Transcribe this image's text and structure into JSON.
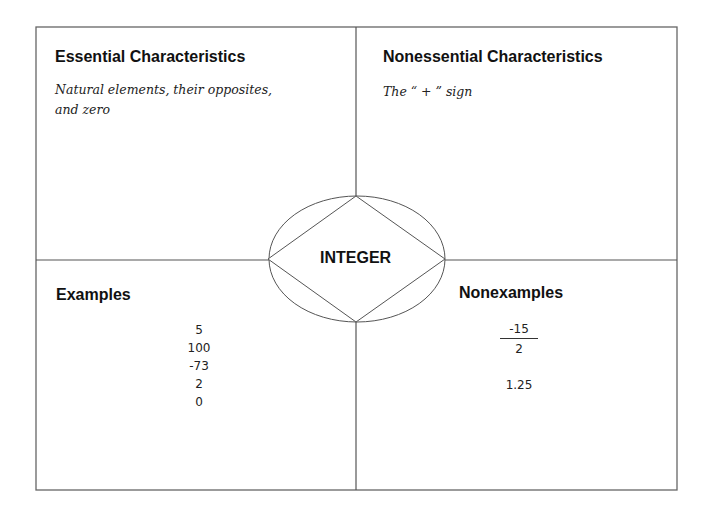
{
  "diagram": {
    "type": "Frayer model",
    "center_term": "INTEGER",
    "quadrants": {
      "top_left": {
        "title": "Essential Characteristics",
        "lines": [
          "Natural elements, their opposites,",
          "and zero"
        ]
      },
      "top_right": {
        "title": "Nonessential Characteristics",
        "lines": [
          "The “ + ” sign"
        ]
      },
      "bottom_left": {
        "title": "Examples",
        "items": [
          "5",
          "100",
          "-73",
          "2",
          "0"
        ]
      },
      "bottom_right": {
        "title": "Nonexamples",
        "fraction": {
          "numerator": "-15",
          "denominator": "2"
        },
        "items": [
          "1.25"
        ]
      }
    },
    "colors": {
      "line": "#555555",
      "text": "#111111",
      "background": "#ffffff"
    }
  }
}
